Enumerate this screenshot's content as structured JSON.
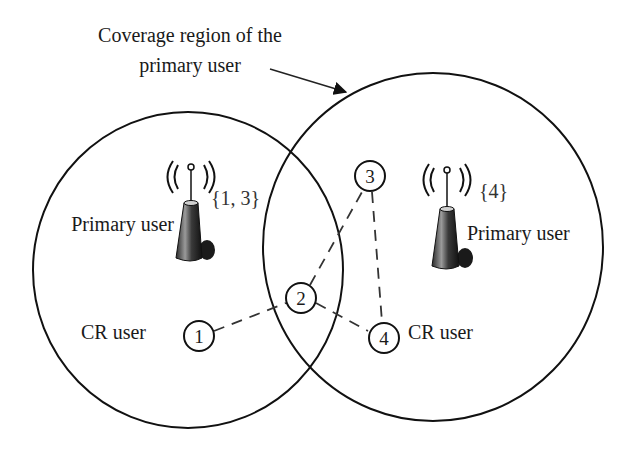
{
  "annotation": {
    "line1": "Coverage region of the",
    "line2": "primary user"
  },
  "primary_users": [
    {
      "label": "Primary user",
      "channel_set": "{1, 3}"
    },
    {
      "label": "Primary user",
      "channel_set": "{4}"
    }
  ],
  "cr_users": [
    {
      "label": "CR user"
    },
    {
      "label": "CR user"
    }
  ],
  "nodes": [
    {
      "id": "1"
    },
    {
      "id": "2"
    },
    {
      "id": "3"
    },
    {
      "id": "4"
    }
  ],
  "links": [
    {
      "from": "1",
      "to": "2"
    },
    {
      "from": "2",
      "to": "3"
    },
    {
      "from": "3",
      "to": "4"
    },
    {
      "from": "2",
      "to": "4"
    }
  ],
  "icons": {
    "tower": "radio-tower-icon"
  },
  "colors": {
    "stroke": "#111111",
    "dash": "#333333",
    "tower_dark": "#1e1e1e",
    "tower_light": "#8a8a8a",
    "background": "#ffffff"
  }
}
